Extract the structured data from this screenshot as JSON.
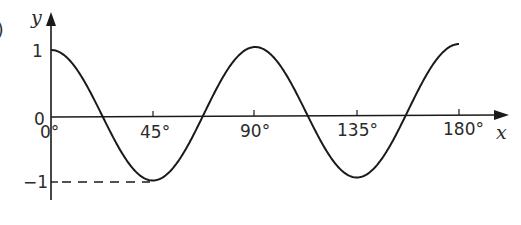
{
  "part_label": ")",
  "chart_data": {
    "type": "line",
    "title": "",
    "function": "y = cos(4x)",
    "xlabel": "x",
    "ylabel": "y",
    "xlim": [
      0,
      180
    ],
    "ylim": [
      -1,
      1
    ],
    "x_ticks": [
      "0°",
      "45°",
      "90°",
      "135°",
      "180°"
    ],
    "y_ticks": [
      "1",
      "0",
      "-1"
    ],
    "x": [
      0,
      22.5,
      45,
      67.5,
      90,
      112.5,
      135,
      157.5,
      180
    ],
    "series": [
      {
        "name": "y",
        "values": [
          1,
          0,
          -1,
          0,
          1,
          0,
          -1,
          0,
          1
        ]
      }
    ],
    "annotations": [
      "dashed line from y-axis at -1 to minimum at 45°"
    ],
    "grid": false
  },
  "axes": {
    "x_label": "x",
    "y_label": "y",
    "origin_label": "0",
    "y_one_label": "1",
    "y_minus_one_label": "−1",
    "x_tick_labels": [
      "0°",
      "45°",
      "90°",
      "135°",
      "180°"
    ]
  },
  "colors": {
    "ink": "#1a1a1a",
    "text": "#2b2b2b"
  }
}
